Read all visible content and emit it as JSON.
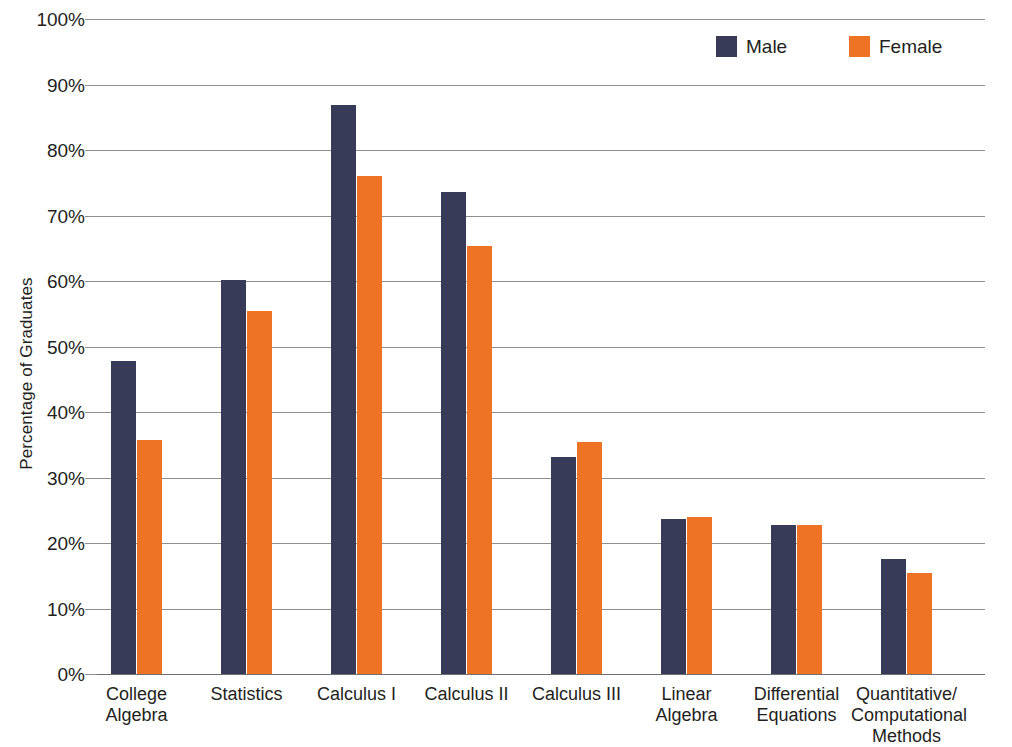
{
  "chart_data": {
    "type": "bar",
    "title": "",
    "xlabel": "",
    "ylabel": "Percentage of Graduates",
    "ylim": [
      0,
      100
    ],
    "ytick_labels": [
      "100%",
      "90%",
      "80%",
      "70%",
      "60%",
      "50%",
      "40%",
      "30%",
      "20%",
      "10%",
      "0%"
    ],
    "ytick_values": [
      100,
      90,
      80,
      70,
      60,
      50,
      40,
      30,
      20,
      10,
      0
    ],
    "grid": true,
    "legend_position": "top-right",
    "categories": [
      "College\nAlgebra",
      "Statistics",
      "Calculus I",
      "Calculus II",
      "Calculus III",
      "Linear\nAlgebra",
      "Differential\nEquations",
      "Quantitative/\nComputational\nMethods"
    ],
    "series": [
      {
        "name": "Male",
        "color": "#383b57",
        "values": [
          47.8,
          60.2,
          86.8,
          73.6,
          33.2,
          23.7,
          22.8,
          17.6
        ]
      },
      {
        "name": "Female",
        "color": "#ef7324",
        "values": [
          35.7,
          55.4,
          76.0,
          65.3,
          35.4,
          24.0,
          22.8,
          15.4
        ]
      }
    ]
  },
  "legend": {
    "items": [
      {
        "label": "Male",
        "color": "#383b57"
      },
      {
        "label": "Female",
        "color": "#ef7324"
      }
    ]
  },
  "axis": {
    "y_title": "Percentage of Graduates"
  },
  "colors": {
    "male": "#383b57",
    "female": "#ef7324",
    "gridline": "#8e8e8e",
    "text": "#231f20",
    "background": "#ffffff"
  }
}
